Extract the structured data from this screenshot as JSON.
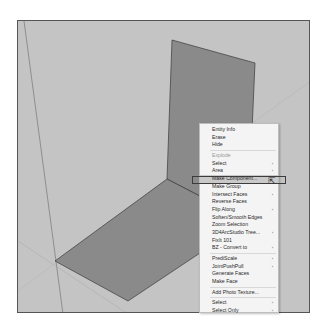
{
  "viewport": {
    "background": "#c4c4c4",
    "face_color": "#8a8a8a"
  },
  "context_menu": {
    "items": [
      {
        "label": "Entity Info",
        "has_submenu": false,
        "enabled": true
      },
      {
        "label": "Erase",
        "has_submenu": false,
        "enabled": true
      },
      {
        "label": "Hide",
        "has_submenu": false,
        "enabled": true
      },
      {
        "separator": true
      },
      {
        "label": "Explode",
        "has_submenu": false,
        "enabled": false
      },
      {
        "label": "Select",
        "has_submenu": true,
        "enabled": true
      },
      {
        "label": "Area",
        "has_submenu": true,
        "enabled": true
      },
      {
        "label": "Make Component...",
        "has_submenu": false,
        "enabled": true,
        "highlighted": true
      },
      {
        "label": "Make Group",
        "has_submenu": false,
        "enabled": true
      },
      {
        "label": "Intersect Faces",
        "has_submenu": true,
        "enabled": true
      },
      {
        "label": "Reverse Faces",
        "has_submenu": false,
        "enabled": true
      },
      {
        "label": "Flip Along",
        "has_submenu": true,
        "enabled": true
      },
      {
        "label": "Soften/Smooth Edges",
        "has_submenu": false,
        "enabled": true
      },
      {
        "label": "Zoom Selection",
        "has_submenu": false,
        "enabled": true
      },
      {
        "label": "3D4ArcStudio Tree...",
        "has_submenu": true,
        "enabled": true
      },
      {
        "label": "FixIt 101",
        "has_submenu": false,
        "enabled": true
      },
      {
        "label": "BZ - Convert to",
        "has_submenu": true,
        "enabled": true
      },
      {
        "separator": true
      },
      {
        "label": "PrediScale",
        "has_submenu": true,
        "enabled": true
      },
      {
        "label": "JointPushPull",
        "has_submenu": true,
        "enabled": true
      },
      {
        "label": "Generate Faces",
        "has_submenu": false,
        "enabled": true
      },
      {
        "label": "Make Face",
        "has_submenu": false,
        "enabled": true
      },
      {
        "separator": true
      },
      {
        "label": "Add Photo Texture...",
        "has_submenu": false,
        "enabled": true
      },
      {
        "separator": true
      },
      {
        "label": "Select",
        "has_submenu": true,
        "enabled": true
      },
      {
        "label": "Select Only",
        "has_submenu": true,
        "enabled": true
      }
    ],
    "submenu_arrow": "›"
  }
}
